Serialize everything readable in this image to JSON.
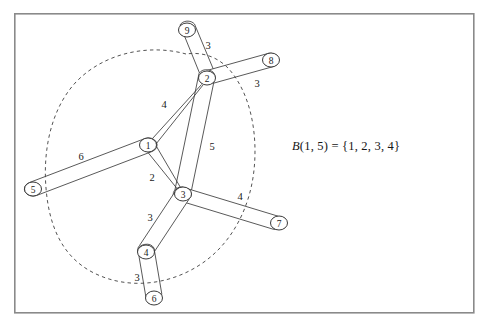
{
  "figure": {
    "frame": {
      "x": 14,
      "y": 13,
      "width": 460,
      "height": 300,
      "color": "#8a8a8a"
    },
    "colors": {
      "stroke": "#3b3b3b",
      "node_stroke": "#2e2e2e",
      "node_fill": "#ffffff",
      "dashed": "#4a4a4a",
      "background": "#ffffff",
      "text": "#1a1a1a"
    }
  },
  "nodes": [
    {
      "id": "1",
      "label": "1",
      "x": 148,
      "y": 145,
      "rx": 8.5,
      "ry": 7.0
    },
    {
      "id": "2",
      "label": "2",
      "x": 207,
      "y": 78,
      "rx": 8.5,
      "ry": 7.0
    },
    {
      "id": "3",
      "label": "3",
      "x": 183,
      "y": 194,
      "rx": 8.5,
      "ry": 7.0
    },
    {
      "id": "4",
      "label": "4",
      "x": 146,
      "y": 252,
      "rx": 8.5,
      "ry": 7.0
    },
    {
      "id": "5",
      "label": "5",
      "x": 33,
      "y": 189,
      "rx": 8.5,
      "ry": 7.0
    },
    {
      "id": "6",
      "label": "6",
      "x": 154,
      "y": 298,
      "rx": 8.5,
      "ry": 7.0
    },
    {
      "id": "7",
      "label": "7",
      "x": 279,
      "y": 223,
      "rx": 8.5,
      "ry": 7.0
    },
    {
      "id": "8",
      "label": "8",
      "x": 271,
      "y": 60,
      "rx": 8.5,
      "ry": 7.0
    },
    {
      "id": "9",
      "label": "9",
      "x": 187,
      "y": 30,
      "rx": 8.5,
      "ry": 7.0
    }
  ],
  "edges": [
    {
      "from": "1",
      "to": "2",
      "weight": "4",
      "style": "thin",
      "label_x": 164,
      "label_y": 104
    },
    {
      "from": "1",
      "to": "3",
      "weight": "2",
      "style": "thin",
      "label_x": 152,
      "label_y": 177
    },
    {
      "from": "1",
      "to": "5",
      "weight": "6",
      "style": "tube",
      "label_x": 81,
      "label_y": 156
    },
    {
      "from": "2",
      "to": "3",
      "weight": "5",
      "style": "tube",
      "label_x": 212,
      "label_y": 146
    },
    {
      "from": "2",
      "to": "8",
      "weight": "3",
      "style": "tube",
      "label_x": 257,
      "label_y": 83
    },
    {
      "from": "2",
      "to": "9",
      "weight": "3",
      "style": "tube",
      "label_x": 208,
      "label_y": 45
    },
    {
      "from": "3",
      "to": "4",
      "weight": "3",
      "style": "tube",
      "label_x": 150,
      "label_y": 217
    },
    {
      "from": "3",
      "to": "7",
      "weight": "4",
      "style": "tube",
      "label_x": 240,
      "label_y": 196
    },
    {
      "from": "4",
      "to": "6",
      "weight": "3",
      "style": "tube",
      "label_x": 137,
      "label_y": 277
    },
    {
      "from": "1",
      "to": "2b",
      "weight": "",
      "style": "thin2",
      "label_x": 0,
      "label_y": 0
    },
    {
      "from": "3",
      "to": "2b",
      "weight": "",
      "style": "thin2",
      "label_x": 0,
      "label_y": 0
    }
  ],
  "ball": {
    "center_node": "1",
    "radius": "5",
    "members": [
      "1",
      "2",
      "3",
      "4"
    ],
    "boundary_path": "M 186,54 C 150,44 105,52 76,82 C 50,110 43,152 46,188 C 49,226 62,256 92,272 C 128,291 172,285 204,262 C 232,242 250,208 254,170 C 258,132 250,92 228,68 C 215,55 200,52 186,54 Z"
  },
  "annotation": {
    "formula_plain": "B(1,5) = {1,2,3,4}",
    "formula_fn": "B",
    "formula_args": "(1, 5)",
    "formula_eq": " = ",
    "formula_set": "{1, 2, 3, 4}",
    "x": 292,
    "y": 146
  }
}
